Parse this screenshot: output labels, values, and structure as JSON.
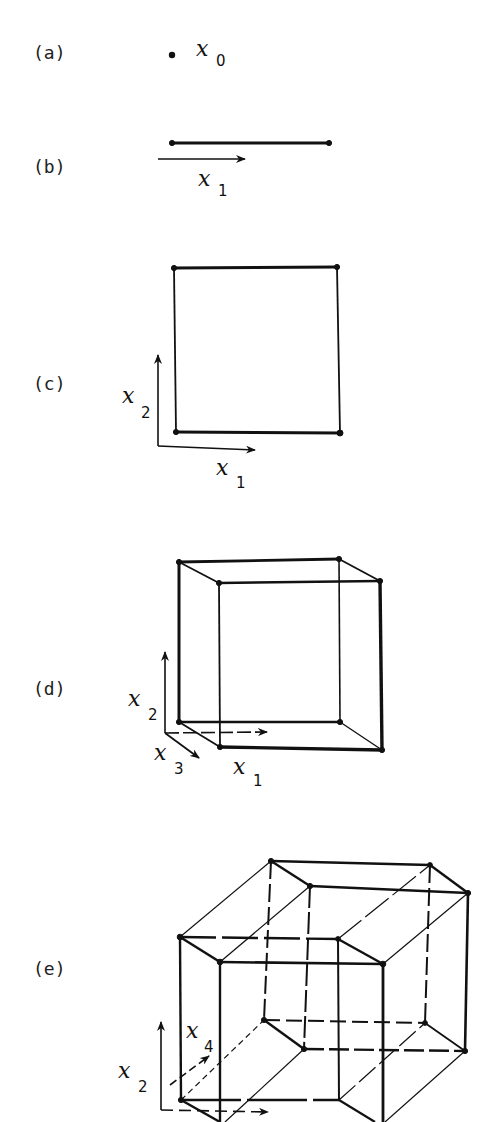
{
  "figure": {
    "panels": [
      {
        "id": "a",
        "label": "(a)",
        "dimension": 0,
        "shape": "point",
        "axes": [
          {
            "var": "x",
            "sub": "0"
          }
        ]
      },
      {
        "id": "b",
        "label": "(b)",
        "dimension": 1,
        "shape": "line segment",
        "axes": [
          {
            "var": "x",
            "sub": "1"
          }
        ]
      },
      {
        "id": "c",
        "label": "(c)",
        "dimension": 2,
        "shape": "square",
        "axes": [
          {
            "var": "x",
            "sub": "1"
          },
          {
            "var": "x",
            "sub": "2"
          }
        ]
      },
      {
        "id": "d",
        "label": "(d)",
        "dimension": 3,
        "shape": "cube",
        "axes": [
          {
            "var": "x",
            "sub": "1"
          },
          {
            "var": "x",
            "sub": "2"
          },
          {
            "var": "x",
            "sub": "3"
          }
        ]
      },
      {
        "id": "e",
        "label": "(e)",
        "dimension": 4,
        "shape": "tesseract",
        "axes": [
          {
            "var": "x",
            "sub": "2"
          },
          {
            "var": "x",
            "sub": "4"
          }
        ]
      }
    ],
    "colors": {
      "ink": "#111111",
      "background": "#ffffff"
    }
  }
}
